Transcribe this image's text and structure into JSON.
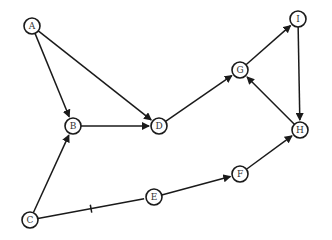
{
  "diagram": {
    "type": "directed-graph",
    "node_radius": 8,
    "nodes": [
      {
        "id": "A",
        "label": "A",
        "x": 32,
        "y": 26
      },
      {
        "id": "B",
        "label": "B",
        "x": 73,
        "y": 126
      },
      {
        "id": "C",
        "label": "C",
        "x": 30,
        "y": 220
      },
      {
        "id": "D",
        "label": "D",
        "x": 159,
        "y": 126
      },
      {
        "id": "E",
        "label": "E",
        "x": 154,
        "y": 197
      },
      {
        "id": "F",
        "label": "F",
        "x": 240,
        "y": 174
      },
      {
        "id": "G",
        "label": "G",
        "x": 240,
        "y": 70
      },
      {
        "id": "H",
        "label": "H",
        "x": 300,
        "y": 130
      },
      {
        "id": "I",
        "label": "I",
        "x": 298,
        "y": 19
      }
    ],
    "edges": [
      {
        "from": "A",
        "to": "B",
        "directed": true
      },
      {
        "from": "A",
        "to": "D",
        "directed": true
      },
      {
        "from": "B",
        "to": "D",
        "directed": true
      },
      {
        "from": "C",
        "to": "B",
        "directed": true
      },
      {
        "from": "C",
        "to": "E",
        "directed": false,
        "tick": true
      },
      {
        "from": "E",
        "to": "F",
        "directed": true
      },
      {
        "from": "F",
        "to": "H",
        "directed": true
      },
      {
        "from": "D",
        "to": "G",
        "directed": true
      },
      {
        "from": "G",
        "to": "I",
        "directed": true
      },
      {
        "from": "I",
        "to": "H",
        "directed": true
      },
      {
        "from": "H",
        "to": "G",
        "directed": true
      }
    ],
    "colors": {
      "stroke": "#1a1a1a",
      "fill": "#ffffff",
      "text": "#333333"
    }
  }
}
